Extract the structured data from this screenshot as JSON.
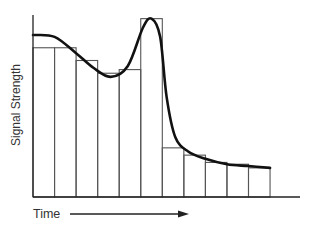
{
  "chart_data": {
    "type": "bar",
    "title": "",
    "xlabel": "Time",
    "ylabel": "Signal Strength",
    "grid": false,
    "legend": null,
    "ylim": [
      0,
      100
    ],
    "categories": [
      "1",
      "2",
      "3",
      "4",
      "5",
      "6",
      "7",
      "8",
      "9",
      "10",
      "11"
    ],
    "series": [
      {
        "name": "Sampled bars",
        "type": "bar",
        "values": [
          82,
          82,
          75,
          68,
          70,
          98,
          27,
          23,
          19,
          18,
          16
        ]
      },
      {
        "name": "Continuous signal",
        "type": "line",
        "x": [
          0,
          1,
          2,
          2.8,
          3.6,
          4.4,
          5.1,
          5.5,
          5.9,
          6.2,
          6.6,
          7.2,
          8,
          9,
          10,
          11
        ],
        "values": [
          89,
          88,
          79,
          71,
          66,
          72,
          93,
          98,
          88,
          55,
          33,
          25,
          21,
          18,
          17,
          16
        ]
      }
    ],
    "annotations": [
      "Time arrow pointing right along x-axis"
    ]
  },
  "colors": {
    "axis": "#222222",
    "bar_stroke": "#555555",
    "curve": "#111111",
    "text": "#333333"
  }
}
